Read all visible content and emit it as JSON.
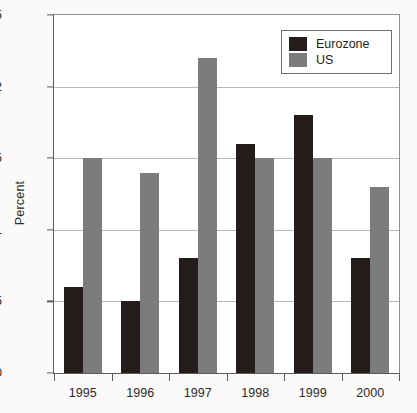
{
  "chart_data": {
    "type": "bar",
    "title": "",
    "xlabel": "",
    "ylabel": "Percent",
    "categories": [
      "1995",
      "1996",
      "1997",
      "1998",
      "1999",
      "2000"
    ],
    "series": [
      {
        "name": "Eurozone",
        "color": "#241b1b",
        "values": [
          0.6,
          0.5,
          0.8,
          1.6,
          1.8,
          0.8
        ]
      },
      {
        "name": "US",
        "color": "#7c7c7c",
        "values": [
          1.5,
          1.4,
          2.2,
          1.5,
          1.5,
          1.3
        ]
      }
    ],
    "ylim": [
      0,
      2.5
    ],
    "ytick_labels": [
      "0",
      "0.5",
      "1",
      "1.5",
      "2",
      "2.5"
    ],
    "ytick_values": [
      0,
      0.5,
      1,
      1.5,
      2,
      2.5
    ],
    "grid": true,
    "legend_position": "top-right"
  },
  "legend": {
    "entries": [
      {
        "label": "Eurozone"
      },
      {
        "label": "US"
      }
    ]
  },
  "colors": {
    "eurozone": "#241b1b",
    "us": "#7c7c7c",
    "gridline": "#b9b9b9",
    "axis": "#5a5a5a",
    "background": "#fbfaf8",
    "plot_background": "#ffffff"
  }
}
